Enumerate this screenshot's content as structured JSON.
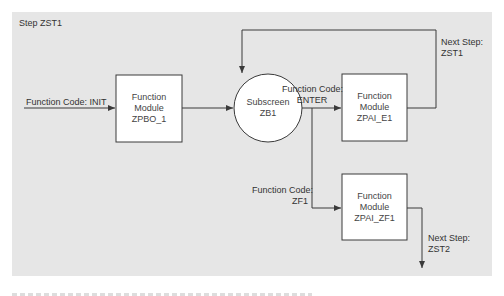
{
  "diagram": {
    "step_title": "Step ZST1",
    "colors": {
      "panel": "#e6e6e6",
      "line": "#3a3a3a",
      "box_fill": "#ffffff"
    },
    "inputs": {
      "init_label": "Function Code: INIT",
      "enter_label_1": "Function Code:",
      "enter_label_2": "ENTER",
      "zf1_label_1": "Function Code:",
      "zf1_label_2": "ZF1"
    },
    "nodes": {
      "pbo": {
        "line1": "Function",
        "line2": "Module",
        "line3": "ZPBO_1"
      },
      "subscreen": {
        "line1": "Subscreen",
        "line2": "ZB1"
      },
      "pai_e1": {
        "line1": "Function",
        "line2": "Module",
        "line3": "ZPAI_E1"
      },
      "pai_zf1": {
        "line1": "Function",
        "line2": "Module",
        "line3": "ZPAI_ZF1"
      }
    },
    "next_steps": {
      "zst1_1": "Next Step:",
      "zst1_2": "ZST1",
      "zst2_1": "Next Step:",
      "zst2_2": "ZST2"
    }
  }
}
